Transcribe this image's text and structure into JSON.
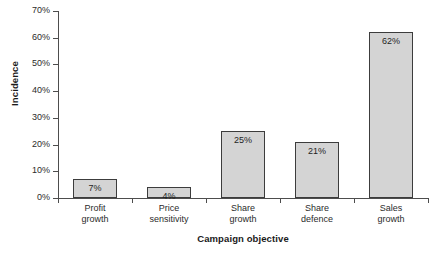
{
  "chart_data": {
    "type": "bar",
    "title": "",
    "subtitle": "",
    "xlabel": "Campaign objective",
    "ylabel": "Incidence",
    "categories": [
      "Profit growth",
      "Price sensitivity",
      "Share growth",
      "Share defence",
      "Sales growth"
    ],
    "category_lines": [
      [
        "Profit",
        "growth"
      ],
      [
        "Price",
        "sensitivity"
      ],
      [
        "Share",
        "growth"
      ],
      [
        "Share",
        "defence"
      ],
      [
        "Sales",
        "growth"
      ]
    ],
    "values": [
      7,
      4,
      25,
      21,
      62
    ],
    "data_labels": [
      "7%",
      "4%",
      "25%",
      "21%",
      "62%"
    ],
    "ylim": [
      0,
      70
    ],
    "ytick_values": [
      0,
      10,
      20,
      30,
      40,
      50,
      60,
      70
    ],
    "ytick_labels": [
      "0%",
      "10%",
      "20%",
      "30%",
      "40%",
      "50%",
      "60%",
      "70%"
    ],
    "grid": false,
    "legend": null,
    "bar_fill_color": "#d4d4d4",
    "bar_border_color": "#3c3c3c",
    "axis_color": "#4d4d4d",
    "background_color": "#ffffff"
  }
}
